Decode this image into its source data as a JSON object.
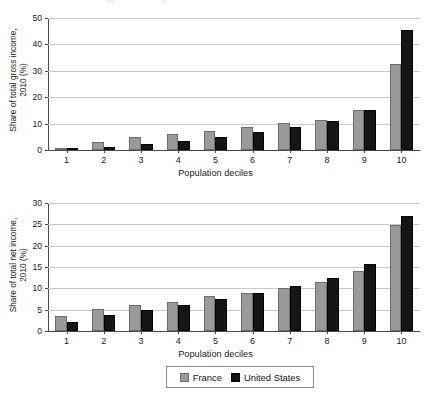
{
  "figure": {
    "background": "#ffffff",
    "series_colors": {
      "france": "#9a9a9a",
      "united_states": "#151515"
    }
  },
  "legend": {
    "position": "bottom-center",
    "entries": [
      {
        "label": "France",
        "swatch": "france-swatch",
        "color": "#9a9a9a"
      },
      {
        "label": "United States",
        "swatch": "united-states-swatch",
        "color": "#151515"
      }
    ]
  },
  "panels": {
    "gross": {
      "ylabel_line1": "Share of total gross income,",
      "ylabel_line2": "2010 (%)",
      "xlabel": "Population deciles",
      "yticks": [
        "0",
        "10",
        "20",
        "30",
        "40",
        "50"
      ],
      "xticks": [
        "1",
        "2",
        "3",
        "4",
        "5",
        "6",
        "7",
        "8",
        "9",
        "10"
      ]
    },
    "net": {
      "ylabel_line1": "Share of total net income,",
      "ylabel_line2": "2010 (%)",
      "xlabel": "Population deciles",
      "yticks": [
        "0",
        "5",
        "10",
        "15",
        "20",
        "25",
        "30"
      ],
      "xticks": [
        "1",
        "2",
        "3",
        "4",
        "5",
        "6",
        "7",
        "8",
        "9",
        "10"
      ]
    }
  },
  "chart_data": [
    {
      "type": "bar",
      "id": "gross-income",
      "title": "",
      "xlabel": "Population deciles",
      "ylabel": "Share of total gross income, 2010 (%)",
      "categories": [
        "1",
        "2",
        "3",
        "4",
        "5",
        "6",
        "7",
        "8",
        "9",
        "10"
      ],
      "ylim": [
        0,
        50
      ],
      "ytick_step": 10,
      "grid": true,
      "legend_position": "bottom",
      "series": [
        {
          "name": "France",
          "color": "#9a9a9a",
          "values": [
            0.6,
            3.1,
            5.0,
            6.0,
            7.1,
            8.7,
            10.1,
            11.4,
            15.0,
            32.5
          ]
        },
        {
          "name": "United States",
          "color": "#151515",
          "values": [
            0.3,
            1.3,
            2.3,
            3.5,
            5.0,
            6.7,
            8.6,
            11.1,
            15.1,
            45.5
          ]
        }
      ]
    },
    {
      "type": "bar",
      "id": "net-income",
      "title": "",
      "xlabel": "Population deciles",
      "ylabel": "Share of total net income, 2010 (%)",
      "categories": [
        "1",
        "2",
        "3",
        "4",
        "5",
        "6",
        "7",
        "8",
        "9",
        "10"
      ],
      "ylim": [
        0,
        30
      ],
      "ytick_step": 5,
      "grid": true,
      "legend_position": "bottom",
      "series": [
        {
          "name": "France",
          "color": "#9a9a9a",
          "values": [
            3.5,
            5.2,
            6.2,
            6.9,
            8.1,
            9.0,
            10.0,
            11.6,
            14.0,
            24.9
          ]
        },
        {
          "name": "United States",
          "color": "#151515",
          "values": [
            2.0,
            3.7,
            4.9,
            6.1,
            7.4,
            9.0,
            10.6,
            12.5,
            15.7,
            26.9
          ]
        }
      ]
    }
  ]
}
